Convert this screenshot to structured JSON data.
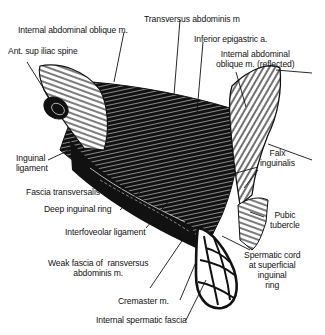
{
  "figure": {
    "colors": {
      "ink": "#111111",
      "background": "#ffffff",
      "highlight": "#e8e8e8"
    },
    "labels": [
      {
        "id": "transversus-abdominis",
        "text": "Transversus abdominis m"
      },
      {
        "id": "internal-abdominal-oblique",
        "text": "Internal abdominal oblique m."
      },
      {
        "id": "inferior-epigastric",
        "text": "Inferior epigastric a."
      },
      {
        "id": "ant-sup-iliac-spine",
        "text": "Ant. sup iliac spine"
      },
      {
        "id": "internal-oblique-reflected",
        "text": "Internal abdominal\noblique m. (reflected)"
      },
      {
        "id": "inguinal-ligament",
        "text": "Inguinal\nligament"
      },
      {
        "id": "falx-inguinalis",
        "text": "Falx\ninguinalis"
      },
      {
        "id": "fascia-transversalis",
        "text": "Fascia transversalis"
      },
      {
        "id": "deep-inguinal-ring",
        "text": "Deep inguinal ring"
      },
      {
        "id": "pubic-tubercle",
        "text": "Pubic\ntubercle"
      },
      {
        "id": "interfoveolar-ligament",
        "text": "Interfoveolar ligament"
      },
      {
        "id": "weak-fascia-transversus",
        "text": "Weak fascia of  ransversus\nabdominis m."
      },
      {
        "id": "spermatic-cord",
        "text": "Spermatic cord\nat superficial\ninguinal\nring"
      },
      {
        "id": "cremaster",
        "text": "Cremaster m."
      },
      {
        "id": "internal-spermatic-fascia",
        "text": "Internal spermatic fascia"
      }
    ]
  }
}
